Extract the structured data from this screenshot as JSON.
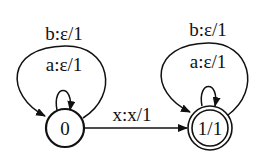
{
  "diagram": {
    "type": "finite-state transducer",
    "states": [
      {
        "id": "s0",
        "label": "0",
        "final": false
      },
      {
        "id": "s1",
        "label": "1/1",
        "final": true
      }
    ],
    "transitions": [
      {
        "from": "s0",
        "to": "s0",
        "label": "a:ε/1"
      },
      {
        "from": "s0",
        "to": "s0",
        "label": "b:ε/1"
      },
      {
        "from": "s0",
        "to": "s1",
        "label": "x:x/1"
      },
      {
        "from": "s1",
        "to": "s1",
        "label": "a:ε/1"
      },
      {
        "from": "s1",
        "to": "s1",
        "label": "b:ε/1"
      }
    ]
  },
  "colors": {
    "stroke": "#111111",
    "background": "#ffffff"
  }
}
